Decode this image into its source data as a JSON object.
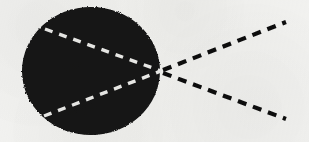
{
  "figure": {
    "width": 309,
    "height": 142,
    "background_color": "#f2f2f0",
    "ink_color": "#101010",
    "highlight_color": "#ececea"
  },
  "body_shape": {
    "name": "filled-black-sphere",
    "shape": "ellipse",
    "center_x": 91,
    "center_y": 71,
    "radius_x": 69,
    "radius_y": 64,
    "fill_color": "#121212",
    "label": ""
  },
  "focal_point": {
    "name": "convergence-point",
    "x": 161,
    "y": 71,
    "label": ""
  },
  "incoming_ray": {
    "name": "incident-axis-ray",
    "style": "solid",
    "color": "#101010",
    "width": 3,
    "x1": 0,
    "y1": 71,
    "x2": 26,
    "y2": 71
  },
  "interior_rays": [
    {
      "name": "interior-upper-ray",
      "style": "dashed",
      "color": "#ececea",
      "width": 3.4,
      "dash": "8 7",
      "x1": 45,
      "y1": 29,
      "x2": 161,
      "y2": 71
    },
    {
      "name": "interior-axis-ray",
      "style": "dashed",
      "color": "#ececea",
      "width": 3.4,
      "dash": "9 7",
      "x1": 24,
      "y1": 71,
      "x2": 161,
      "y2": 71
    },
    {
      "name": "interior-lower-ray",
      "style": "dashed",
      "color": "#ececea",
      "width": 3.4,
      "dash": "8 7",
      "x1": 44,
      "y1": 116,
      "x2": 161,
      "y2": 71
    }
  ],
  "emergent_rays": [
    {
      "name": "emergent-upper-ray",
      "style": "dashed",
      "color": "#101010",
      "width": 4.2,
      "dash": "9 7",
      "x1": 163,
      "y1": 70,
      "x2": 286,
      "y2": 22
    },
    {
      "name": "emergent-axis-ray",
      "style": "dashed",
      "color": "#101010",
      "width": 4.0,
      "dash": "6 6",
      "x1": 163,
      "y1": 71,
      "x2": 309,
      "y2": 71
    },
    {
      "name": "emergent-lower-ray",
      "style": "dashed",
      "color": "#101010",
      "width": 4.2,
      "dash": "9 7",
      "x1": 163,
      "y1": 73,
      "x2": 286,
      "y2": 119
    }
  ]
}
